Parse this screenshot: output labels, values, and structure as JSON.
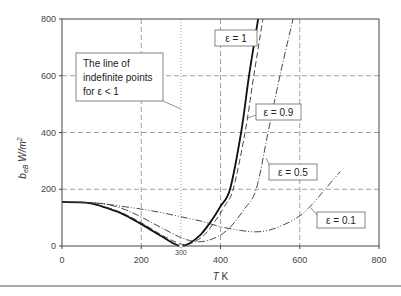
{
  "chart_data": {
    "type": "line",
    "title": "",
    "xlabel": "T K",
    "ylabel": "b_eB W/m²",
    "xlim": [
      0,
      800
    ],
    "ylim": [
      0,
      800
    ],
    "x_ticks": [
      "0",
      "200",
      "400",
      "600",
      "800"
    ],
    "x_extra_tick": "300",
    "y_ticks": [
      "0",
      "200",
      "400",
      "600",
      "800"
    ],
    "grid": true,
    "annotation": {
      "lines": [
        "The line of",
        "indefinite points",
        "for ε < 1"
      ],
      "x": 300
    },
    "series": [
      {
        "name": "ε = 1",
        "label": "ε = 1",
        "style": "solid-thick",
        "x": [
          0,
          60,
          100,
          150,
          200,
          250,
          280,
          300,
          320,
          350,
          380,
          400,
          424,
          452,
          472,
          495
        ],
        "values": [
          155,
          153,
          140,
          115,
          77,
          35,
          10,
          0,
          8,
          40,
          95,
          140,
          200,
          400,
          600,
          800
        ]
      },
      {
        "name": "ε = 0.9",
        "label": "ε = 0.9",
        "style": "dashed",
        "x": [
          0,
          60,
          100,
          150,
          200,
          250,
          290,
          310,
          330,
          360,
          390,
          410,
          432,
          462,
          484,
          507
        ],
        "values": [
          155,
          153,
          141,
          118,
          82,
          40,
          12,
          5,
          12,
          40,
          95,
          140,
          200,
          400,
          600,
          800
        ]
      },
      {
        "name": "ε = 0.5",
        "label": "ε = 0.5",
        "style": "dash-dot",
        "x": [
          0,
          80,
          120,
          160,
          200,
          250,
          300,
          340,
          380,
          420,
          460,
          490,
          520,
          550,
          583
        ],
        "values": [
          155,
          152,
          145,
          128,
          102,
          65,
          30,
          15,
          25,
          60,
          130,
          200,
          400,
          600,
          800
        ]
      },
      {
        "name": "ε = 0.1",
        "label": "ε = 0.1",
        "style": "dash-dot-dot",
        "x": [
          0,
          80,
          150,
          200,
          250,
          300,
          350,
          400,
          450,
          487,
          520,
          560,
          600,
          630,
          664,
          702
        ],
        "values": [
          155,
          152,
          140,
          130,
          118,
          103,
          88,
          68,
          55,
          50,
          55,
          75,
          106,
          145,
          200,
          262
        ]
      }
    ]
  }
}
